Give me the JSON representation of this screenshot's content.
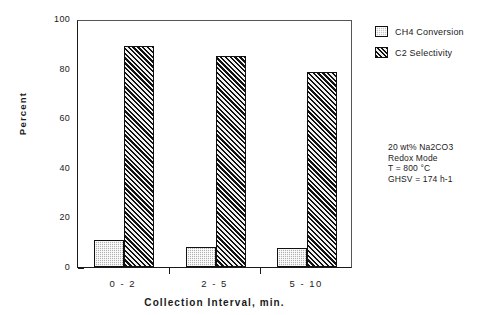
{
  "chart_data": {
    "type": "bar",
    "title": "",
    "subtitle": "",
    "xlabel": "Collection Interval, min.",
    "ylabel": "Percent",
    "categories": [
      "0 - 2",
      "2 - 5",
      "5 - 10"
    ],
    "series": [
      {
        "name": "CH4 Conversion",
        "values": [
          11,
          8,
          7.5
        ],
        "pattern": "stipple",
        "color": "#b0b0b0"
      },
      {
        "name": "C2 Selectivity",
        "values": [
          89,
          85,
          78.5
        ],
        "pattern": "diagonal-hatch",
        "color": "#5a5a5a"
      }
    ],
    "ylim": [
      0,
      100
    ],
    "y_ticks": [
      0,
      20,
      40,
      60,
      80,
      100
    ],
    "y_tick_labels": [
      "0",
      "20",
      "40",
      "60",
      "80",
      "100"
    ],
    "y_minor_ticks": [
      10,
      30,
      50,
      70,
      90
    ],
    "grid": false,
    "legend_position": "right-top"
  },
  "legend": {
    "items": [
      {
        "label": "CH4 Conversion"
      },
      {
        "label": "C2 Selectivity"
      }
    ]
  },
  "annotation": {
    "lines": [
      "20 wt% Na2CO3",
      "Redox Mode",
      "T = 800 °C",
      "GHSV = 174 h-1"
    ]
  }
}
